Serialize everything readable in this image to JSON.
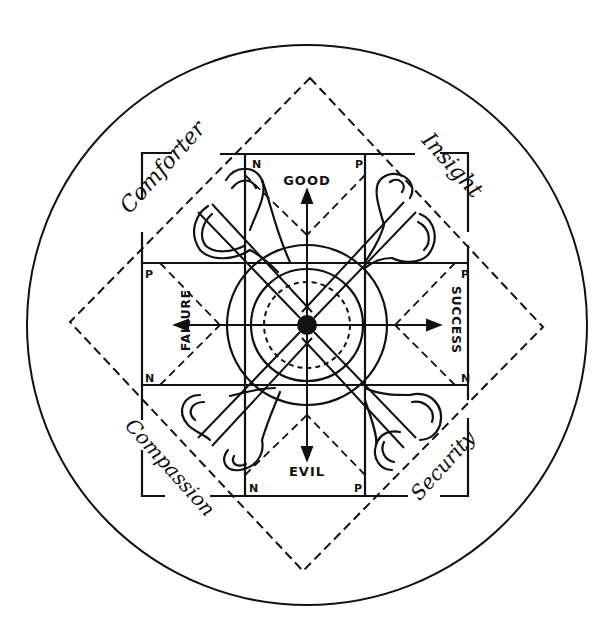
{
  "diagram": {
    "type": "symbolic-compass-diagram",
    "colors": {
      "ink": "#111111",
      "background": "#ffffff"
    },
    "axes": {
      "top": "GOOD",
      "bottom": "EVIL",
      "left": "FAILURE",
      "right": "SUCCESS"
    },
    "corner_markers": {
      "top_left": "N",
      "top_right": "P",
      "right_top": "P",
      "right_bottom": "N",
      "bottom_right": "P",
      "bottom_left": "N",
      "left_bottom": "N",
      "left_top": "P"
    },
    "quadrant_labels": {
      "top_left": "Comforter",
      "top_right": "Insight",
      "bottom_left": "Compassion",
      "bottom_right": "Security"
    },
    "elements": [
      "outer-circle",
      "dashed-diamond",
      "square-frame",
      "central-cross-grid",
      "diagonal-lines",
      "concentric-circles",
      "dashed-inner-circle",
      "center-dot",
      "four-directional-arrows",
      "four-horn-shapes"
    ]
  }
}
